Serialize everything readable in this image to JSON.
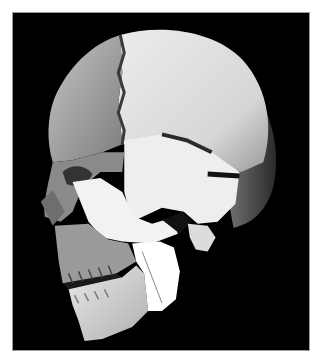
{
  "image": {
    "subject": "3D rendered human skull, left lateral oblique view",
    "background_color": "#000000",
    "border_color": "#ffffff",
    "regions": [
      {
        "name": "frontal-bone",
        "tone": "#a8a8a8"
      },
      {
        "name": "parietal-bone",
        "tone": "#e4e4e4"
      },
      {
        "name": "temporal-bone",
        "tone": "#eeeeee"
      },
      {
        "name": "occipital-bone",
        "tone": "#5a5a5a"
      },
      {
        "name": "zygomatic-arch",
        "tone": "#f2f2f2"
      },
      {
        "name": "maxilla",
        "tone": "#9a9a9a"
      },
      {
        "name": "mandible",
        "tone": "#d8d8d8"
      },
      {
        "name": "mandible-ramus",
        "tone": "#ffffff"
      }
    ]
  }
}
